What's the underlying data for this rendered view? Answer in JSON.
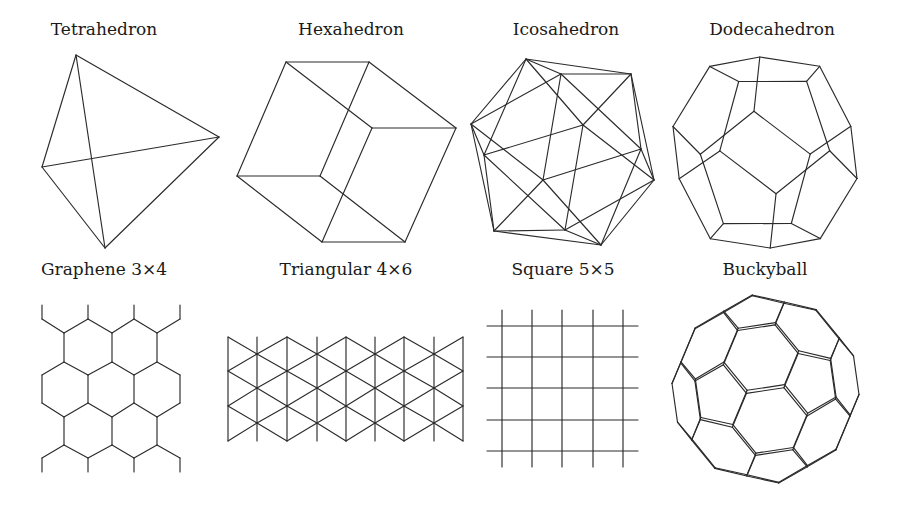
{
  "figure": {
    "background": "#ffffff",
    "stroke_color": "#2b2b2b",
    "panels": [
      {
        "id": "tetrahedron",
        "label": "Tetrahedron",
        "label_pos": [
          104,
          35
        ],
        "type": "graph",
        "vertices": [
          [
            76,
            55
          ],
          [
            42,
            167
          ],
          [
            219,
            137
          ],
          [
            105,
            248
          ]
        ],
        "edges": [
          [
            0,
            1
          ],
          [
            0,
            2
          ],
          [
            0,
            3
          ],
          [
            1,
            2
          ],
          [
            1,
            3
          ],
          [
            2,
            3
          ]
        ]
      },
      {
        "id": "hexahedron",
        "label": "Hexahedron",
        "label_pos": [
          351,
          35
        ],
        "type": "graph",
        "vertices": [
          [
            286,
            62
          ],
          [
            369,
            62
          ],
          [
            456,
            128
          ],
          [
            372,
            128
          ],
          [
            237,
            176
          ],
          [
            320,
            176
          ],
          [
            405,
            242
          ],
          [
            322,
            242
          ]
        ],
        "edges": [
          [
            0,
            1
          ],
          [
            1,
            2
          ],
          [
            2,
            3
          ],
          [
            3,
            0
          ],
          [
            0,
            4
          ],
          [
            1,
            5
          ],
          [
            2,
            6
          ],
          [
            3,
            7
          ],
          [
            4,
            5
          ],
          [
            5,
            6
          ],
          [
            6,
            7
          ],
          [
            7,
            4
          ]
        ]
      },
      {
        "id": "icosahedron",
        "label": "Icosahedron",
        "label_pos": [
          566,
          35
        ],
        "type": "graph",
        "vertices": [
          [
            526,
            59
          ],
          [
            561,
            74
          ],
          [
            631,
            74
          ],
          [
            471,
            124
          ],
          [
            484,
            155
          ],
          [
            583,
            125
          ],
          [
            641,
            149
          ],
          [
            654,
            180
          ],
          [
            543,
            180
          ],
          [
            494,
            231
          ],
          [
            565,
            230
          ],
          [
            601,
            245
          ]
        ],
        "edges": [
          [
            0,
            1
          ],
          [
            0,
            2
          ],
          [
            0,
            3
          ],
          [
            0,
            4
          ],
          [
            0,
            5
          ],
          [
            1,
            2
          ],
          [
            2,
            5
          ],
          [
            5,
            4
          ],
          [
            4,
            3
          ],
          [
            3,
            1
          ],
          [
            1,
            8
          ],
          [
            1,
            6
          ],
          [
            2,
            6
          ],
          [
            2,
            7
          ],
          [
            5,
            7
          ],
          [
            5,
            10
          ],
          [
            4,
            10
          ],
          [
            4,
            9
          ],
          [
            3,
            9
          ],
          [
            3,
            8
          ],
          [
            10,
            9
          ],
          [
            9,
            8
          ],
          [
            8,
            6
          ],
          [
            6,
            7
          ],
          [
            7,
            10
          ],
          [
            11,
            10
          ],
          [
            11,
            9
          ],
          [
            11,
            8
          ],
          [
            11,
            6
          ],
          [
            11,
            7
          ]
        ]
      },
      {
        "id": "dodecahedron",
        "label": "Dodecahedron",
        "label_pos": [
          772,
          35
        ],
        "type": "polyhedron",
        "solid": "dodecahedron",
        "rotation_deg": [
          -18,
          28,
          8
        ],
        "bbox": [
          673,
          57,
          857,
          248
        ]
      },
      {
        "id": "graphene",
        "label": "Graphene 3×4",
        "label_pos": [
          104,
          275
        ],
        "type": "lattice",
        "lattice": "honeycomb",
        "size": "3×4",
        "columns_x": [
          42,
          64,
          88,
          112,
          134,
          157,
          180
        ],
        "rows_y": [
          305,
          319,
          333,
          362,
          375,
          403,
          417,
          445,
          458,
          472
        ]
      },
      {
        "id": "triangular",
        "label": "Triangular 4×6",
        "label_pos": [
          346,
          275
        ],
        "type": "lattice",
        "lattice": "triangular",
        "size": "4×6",
        "columns_x": [
          228,
          257,
          287,
          317,
          346,
          375,
          404,
          434,
          463
        ],
        "rows_y": [
          337,
          354,
          371,
          388,
          406,
          423,
          441
        ]
      },
      {
        "id": "square",
        "label": "Square 5×5",
        "label_pos": [
          563,
          275
        ],
        "type": "lattice",
        "lattice": "square",
        "size": "5×5",
        "columns_x": [
          502,
          532,
          562,
          593,
          623
        ],
        "rows_y": [
          326,
          357,
          388,
          420,
          451
        ],
        "v_extent": [
          310,
          467
        ],
        "h_extent": [
          487,
          638
        ]
      },
      {
        "id": "buckyball",
        "label": "Buckyball",
        "label_pos": [
          765,
          275
        ],
        "type": "polyhedron",
        "solid": "truncated-icosahedron",
        "rotation_deg": [
          22,
          -30,
          12
        ],
        "bbox": [
          672,
          295,
          859,
          483
        ]
      }
    ]
  }
}
